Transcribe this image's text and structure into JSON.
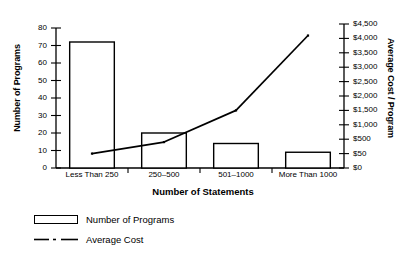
{
  "chart_data": {
    "type": "bar",
    "title": "",
    "xlabel": "Number of Statements",
    "ylabel": "Number of Programs",
    "y2label": "Average Cost / Program",
    "categories": [
      "Less Than 250",
      "250–500",
      "501–1000",
      "More Than 1000"
    ],
    "grid": false,
    "legend_position": "below-left",
    "ylim": [
      0,
      80
    ],
    "y_ticks": [
      "0",
      "10",
      "20",
      "30",
      "40",
      "50",
      "60",
      "70",
      "80"
    ],
    "y2_ticks": [
      "$0",
      "$50",
      "$500",
      "$1,000",
      "$1,500",
      "$2,000",
      "$2,500",
      "$3,000",
      "$3,500",
      "$4,000",
      "$4,500"
    ],
    "series": [
      {
        "name": "Number of Programs",
        "type": "bar",
        "axis": "left",
        "values": [
          72,
          20,
          14,
          9
        ]
      },
      {
        "name": "Average Cost",
        "type": "line",
        "axis": "right",
        "values": [
          50,
          400,
          1500,
          4100
        ],
        "value_labels": [
          "$50",
          "$400",
          "$1,500",
          "$4,100"
        ],
        "tick_positions": [
          1.0,
          1.8,
          4.0,
          9.2
        ]
      }
    ],
    "colors": {
      "bar_fill": "#ffffff",
      "bar_stroke": "#000000",
      "line": "#000000",
      "background": "#ffffff"
    }
  },
  "legend": {
    "items": [
      {
        "label": "Number of Programs",
        "marker": "open-rectangle"
      },
      {
        "label": "Average Cost",
        "marker": "dash-dot-line"
      }
    ]
  }
}
